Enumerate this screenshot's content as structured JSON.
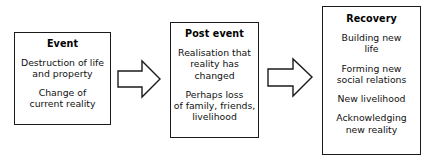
{
  "diagram": {
    "orientation": "left-to-right",
    "background_color": "#ffffff",
    "border_color": "#1b1b1b",
    "text_color": "#111111",
    "stages": [
      {
        "id": "event",
        "title": "Event",
        "paragraphs": [
          "Destruction of life\nand property",
          "Change of\ncurrent reality"
        ]
      },
      {
        "id": "post-event",
        "title": "Post event",
        "paragraphs": [
          "Realisation that\nreality has\nchanged",
          "Perhaps loss\nof family, friends,\nlivelihood"
        ]
      },
      {
        "id": "recovery",
        "title": "Recovery",
        "paragraphs": [
          "Building new\nlife",
          "Forming new\nsocial relations",
          "New livelihood",
          "Acknowledging\nnew reality"
        ]
      }
    ],
    "connectors": [
      {
        "id": "arrow-1",
        "icon": "block-arrow-right-icon",
        "from": "event",
        "to": "post-event"
      },
      {
        "id": "arrow-2",
        "icon": "block-arrow-right-icon",
        "from": "post-event",
        "to": "recovery"
      }
    ]
  }
}
